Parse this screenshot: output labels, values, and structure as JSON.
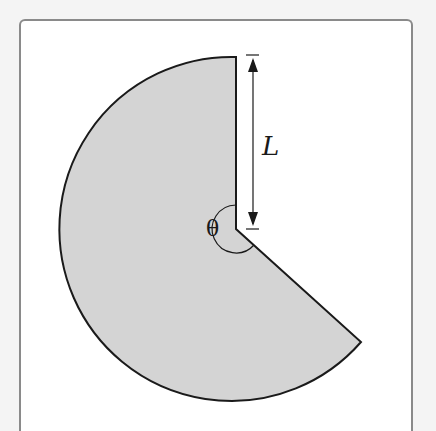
{
  "diagram": {
    "type": "circular-sector",
    "labels": {
      "length": "L",
      "angle": "θ"
    },
    "colors": {
      "fill": "#d4d4d4",
      "stroke": "#1a1a1a",
      "frame": "#8a8a8a",
      "background": "#ffffff"
    },
    "geometry": {
      "center": [
        236,
        229
      ],
      "radius": 172,
      "start_angle_deg": -90,
      "end_angle_deg": 41,
      "missing_wedge": "between 12 o'clock and lower-right (~4:30)"
    }
  }
}
